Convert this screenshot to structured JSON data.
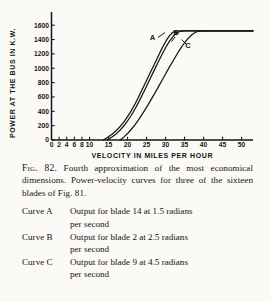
{
  "figure": {
    "caption_prefix": "Fig. 82.",
    "caption_body": " Fourth approximation of the most economical dimensions. Power-velocity curves for three of the sixteen blades of Fig. 81.",
    "curve_entries": [
      {
        "name": "Curve A",
        "line1": "Output for blade 14 at 1.5 radians",
        "line2": "per second"
      },
      {
        "name": "Curve B",
        "line1": "Output for blade  2 at 2.5 radians",
        "line2": "per second"
      },
      {
        "name": "Curve C",
        "line1": "Output for blade  9 at 4.5 radians",
        "line2": "per second"
      }
    ]
  },
  "chart_data": {
    "type": "line",
    "title": "",
    "xlabel": "VELOCITY IN MILES PER HOUR",
    "ylabel": "POWER AT THE BUS IN K.W.",
    "xlim": [
      0,
      53
    ],
    "ylim": [
      0,
      1700
    ],
    "grid": false,
    "legend": "inline-labels",
    "xticks": [
      0,
      2,
      4,
      6,
      8,
      10,
      15,
      20,
      25,
      30,
      35,
      40,
      45,
      50
    ],
    "xtick_labels": [
      "0",
      "2",
      "4",
      "6",
      "8",
      "10",
      "15",
      "20",
      "25",
      "30",
      "35",
      "40",
      "45",
      "50"
    ],
    "yticks": [
      0,
      200,
      400,
      600,
      800,
      1000,
      1200,
      1400,
      1600
    ],
    "ytick_labels": [
      "0",
      "200",
      "400",
      "600",
      "800",
      "1000",
      "1200",
      "1400",
      "1600"
    ],
    "plateau_value": 1520,
    "series": [
      {
        "name": "A",
        "label": "A",
        "annotation": "Output for blade 14 at 1.5 radians per second",
        "x": [
          13.6,
          15,
          16,
          17,
          18,
          19,
          20,
          21,
          22,
          23,
          24,
          25,
          26,
          27,
          28,
          29,
          30,
          31,
          32,
          33,
          36,
          40,
          45,
          50,
          53
        ],
        "y": [
          0,
          45,
          85,
          130,
          185,
          250,
          325,
          410,
          505,
          610,
          720,
          830,
          940,
          1050,
          1160,
          1270,
          1370,
          1450,
          1505,
          1520,
          1520,
          1520,
          1520,
          1520,
          1520
        ]
      },
      {
        "name": "B",
        "label": "B",
        "annotation": "Output for blade 2 at 2.5 radians per second",
        "x": [
          14.6,
          16,
          17,
          18,
          19,
          20,
          21,
          22,
          23,
          24,
          25,
          26,
          27,
          28,
          29,
          30,
          31,
          32,
          33,
          34,
          35,
          38,
          42,
          46,
          50,
          53
        ],
        "y": [
          0,
          45,
          85,
          135,
          195,
          265,
          345,
          435,
          535,
          640,
          750,
          860,
          970,
          1080,
          1185,
          1285,
          1375,
          1445,
          1495,
          1515,
          1520,
          1520,
          1520,
          1520,
          1520,
          1520
        ]
      },
      {
        "name": "C",
        "label": "C",
        "annotation": "Output for blade 9 at 4.5 radians per second",
        "x": [
          18.1,
          19,
          20,
          21,
          22,
          23,
          24,
          25,
          26,
          27,
          28,
          29,
          30,
          31,
          32,
          33,
          34,
          35,
          36,
          37,
          38,
          39,
          40,
          44,
          48,
          50,
          53
        ],
        "y": [
          0,
          40,
          90,
          150,
          215,
          290,
          370,
          455,
          545,
          635,
          730,
          825,
          920,
          1015,
          1105,
          1195,
          1280,
          1355,
          1420,
          1470,
          1505,
          1518,
          1520,
          1520,
          1520,
          1520,
          1520
        ]
      }
    ]
  }
}
